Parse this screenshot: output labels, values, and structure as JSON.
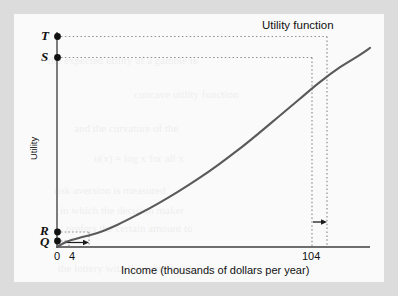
{
  "figure": {
    "annotation_label": "Utility function",
    "x_axis_title": "Income (thousands of dollars per year)",
    "y_axis_title": "Utility",
    "x_ticks": [
      "0",
      "4",
      "104"
    ],
    "point_labels": [
      "T",
      "S",
      "R",
      "Q"
    ]
  },
  "chart_data": {
    "type": "line",
    "title": "",
    "subtitle": "",
    "xlabel": "Income (thousands of dollars per year)",
    "ylabel": "Utility",
    "xlim": [
      0,
      124
    ],
    "ylim": [
      0,
      1.08
    ],
    "grid": false,
    "legend_position": "none",
    "annotations": [
      {
        "text": "Utility function",
        "x": 100,
        "y": 1.02,
        "note": "curve label at top right"
      },
      {
        "text": "T",
        "x": 0,
        "y": 0.925,
        "note": "utility of income 116 read on vertical axis"
      },
      {
        "text": "S",
        "x": 0,
        "y": 0.827,
        "note": "utility of income 104 read on vertical axis"
      },
      {
        "text": "R",
        "x": 0,
        "y": 0.07,
        "note": "utility of income 16 read on vertical axis"
      },
      {
        "text": "Q",
        "x": 0,
        "y": 0.028,
        "note": "utility of income 4 read on vertical axis"
      }
    ],
    "markers": [
      {
        "label": "T",
        "x": 0,
        "y": 0.925
      },
      {
        "label": "S",
        "x": 0,
        "y": 0.827
      },
      {
        "label": "R",
        "x": 0,
        "y": 0.07
      },
      {
        "label": "Q",
        "x": 0,
        "y": 0.028
      }
    ],
    "dotted_guides": [
      {
        "from": "T",
        "type": "horizontal",
        "y": 0.925,
        "x_end": 116
      },
      {
        "from": "S",
        "type": "horizontal",
        "y": 0.827,
        "x_end": 104
      },
      {
        "type": "vertical",
        "x": 104,
        "y_end": 0.827
      },
      {
        "type": "vertical",
        "x": 116,
        "y_end": 0.925
      },
      {
        "from": "R",
        "type": "horizontal",
        "y": 0.07,
        "x_end": 16
      },
      {
        "type": "vertical",
        "x": 16,
        "y_end": 0.07
      },
      {
        "from": "Q",
        "type": "horizontal",
        "y": 0.028,
        "x_end": 4
      },
      {
        "type": "vertical",
        "x": 4,
        "y_end": 0.028
      }
    ],
    "arrows": [
      {
        "type": "horizontal-right",
        "x_start": 4,
        "x_end": 16,
        "y": 0.022,
        "note": "income increase of 12 at low income"
      },
      {
        "type": "horizontal-right",
        "x_start": 104,
        "x_end": 116,
        "y": 0.108,
        "note": "income increase of 12 at high income"
      }
    ],
    "series": [
      {
        "name": "Utility function",
        "comment": "convex increasing utility of income curve",
        "x": [
          0,
          4,
          10,
          16,
          24,
          32,
          40,
          48,
          56,
          64,
          72,
          80,
          88,
          96,
          104,
          112,
          120,
          124
        ],
        "y": [
          0.0,
          0.028,
          0.05,
          0.07,
          0.112,
          0.163,
          0.218,
          0.278,
          0.343,
          0.414,
          0.49,
          0.572,
          0.657,
          0.742,
          0.827,
          0.902,
          0.965,
          1.0
        ]
      }
    ],
    "colors": {
      "curve": "#5a5a5a",
      "axis": "#6e6e6e",
      "marker": "#111111",
      "guide": "#9a9a9a",
      "panel_background": "#fafafa",
      "mat_background": "#dcdcdc"
    }
  },
  "ghost_text": [
    {
      "t": "the expected utility of a gamble is",
      "x": 34,
      "y": 40
    },
    {
      "t": "concave utility function",
      "x": 120,
      "y": 74
    },
    {
      "t": "and the curvature of the",
      "x": 60,
      "y": 108
    },
    {
      "t": "u(x) = log x for all x",
      "x": 80,
      "y": 138
    },
    {
      "t": "risk aversion is measured",
      "x": 40,
      "y": 170
    },
    {
      "t": "in which the decision maker",
      "x": 46,
      "y": 190
    },
    {
      "t": "prefers the certain amount to",
      "x": 52,
      "y": 208
    },
    {
      "t": "the lottery with the same mean",
      "x": 44,
      "y": 248
    }
  ]
}
